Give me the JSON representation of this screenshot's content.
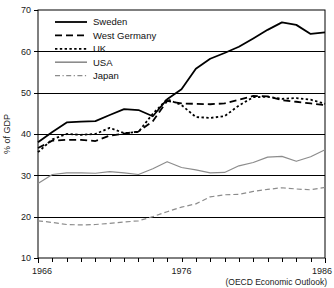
{
  "chart_data": {
    "type": "line",
    "title": "",
    "xlabel": "",
    "ylabel": "% of GDP",
    "source_note": "(OECD Economic Outlook)",
    "grid": true,
    "legend_position": "top-left",
    "xlim": [
      1966,
      1986
    ],
    "ylim": [
      10,
      70
    ],
    "y_ticks": [
      10,
      20,
      30,
      40,
      50,
      60,
      70
    ],
    "y_tick_labels": [
      "10",
      "20",
      "30",
      "40",
      "50",
      "60",
      "70"
    ],
    "x_ticks": [
      1966,
      1967,
      1968,
      1969,
      1970,
      1971,
      1972,
      1973,
      1974,
      1975,
      1976,
      1977,
      1978,
      1979,
      1980,
      1981,
      1982,
      1983,
      1984,
      1985,
      1986
    ],
    "x_tick_labels_shown": [
      "1966",
      "1976",
      "1986"
    ],
    "x_tick_label_years": [
      1966,
      1976,
      1986
    ],
    "x": [
      1966,
      1967,
      1968,
      1969,
      1970,
      1971,
      1972,
      1973,
      1974,
      1975,
      1976,
      1977,
      1978,
      1979,
      1980,
      1981,
      1982,
      1983,
      1984,
      1985,
      1986
    ],
    "series": [
      {
        "name": "Sweden",
        "dash": "none",
        "color": "#000000",
        "width": 1.8,
        "values": [
          38.0,
          40.5,
          42.8,
          43.0,
          43.1,
          44.6,
          46.0,
          45.8,
          44.3,
          48.4,
          50.8,
          55.8,
          58.2,
          59.6,
          61.1,
          63.1,
          65.2,
          67.0,
          66.4,
          64.2,
          64.6
        ]
      },
      {
        "name": "West Germany",
        "dash": "dashed",
        "color": "#000000",
        "width": 1.8,
        "values": [
          36.6,
          38.4,
          38.6,
          38.6,
          38.3,
          39.6,
          40.1,
          40.6,
          43.1,
          48.0,
          47.4,
          47.3,
          47.2,
          47.4,
          48.3,
          49.2,
          49.1,
          48.2,
          47.8,
          47.4,
          47.0
        ]
      },
      {
        "name": "UK",
        "dash": "dotted",
        "color": "#000000",
        "width": 1.8,
        "values": [
          35.6,
          38.7,
          40.0,
          39.8,
          40.0,
          41.5,
          40.2,
          40.5,
          44.9,
          48.4,
          47.0,
          44.1,
          43.9,
          44.3,
          46.9,
          48.9,
          49.0,
          48.5,
          48.7,
          48.3,
          47.3
        ]
      },
      {
        "name": "USA",
        "dash": "none",
        "color": "#8c8c8c",
        "width": 1.2,
        "values": [
          28.0,
          30.2,
          30.6,
          30.6,
          30.5,
          30.9,
          30.6,
          30.2,
          31.6,
          33.3,
          31.9,
          31.3,
          30.6,
          30.7,
          32.3,
          33.1,
          34.4,
          34.6,
          33.4,
          34.5,
          36.2
        ]
      },
      {
        "name": "Japan",
        "dash": "dashed",
        "color": "#8c8c8c",
        "width": 1.2,
        "values": [
          19.0,
          18.6,
          18.1,
          18.0,
          18.1,
          18.4,
          18.7,
          19.0,
          20.0,
          21.2,
          22.3,
          23.1,
          24.8,
          25.3,
          25.4,
          26.1,
          26.6,
          27.0,
          26.7,
          26.5,
          27.1
        ]
      }
    ],
    "legend": [
      {
        "label": "Sweden",
        "dash": "none",
        "color": "#000000",
        "width": 1.8
      },
      {
        "label": "West Germany",
        "dash": "dashed",
        "color": "#000000",
        "width": 1.8
      },
      {
        "label": "UK",
        "dash": "dotted",
        "color": "#000000",
        "width": 1.8
      },
      {
        "label": "USA",
        "dash": "none",
        "color": "#8c8c8c",
        "width": 1.6
      },
      {
        "label": "Japan",
        "dash": "dashdot",
        "color": "#8c8c8c",
        "width": 1.2
      }
    ]
  }
}
